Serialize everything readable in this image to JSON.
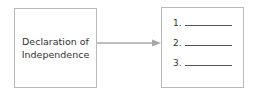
{
  "diagram": {
    "source_box": {
      "line1": "Declaration of",
      "line2": "Independence"
    },
    "target_box": {
      "items": [
        {
          "number": "1."
        },
        {
          "number": "2."
        },
        {
          "number": "3."
        }
      ]
    },
    "connector": {
      "type": "arrow",
      "direction": "right",
      "color": "#a8a8a8"
    },
    "colors": {
      "border": "#b9b9b9",
      "text": "#333333",
      "background": "#ffffff"
    }
  }
}
